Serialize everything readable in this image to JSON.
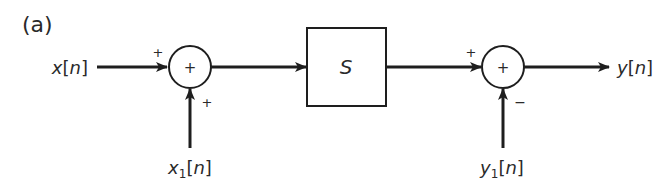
{
  "figure": {
    "panel_label": "(a)",
    "colors": {
      "stroke": "#1e1e1e",
      "text": "#2a2a2a",
      "background": "#ffffff"
    }
  },
  "signals": {
    "input": {
      "name": "x",
      "index": "n"
    },
    "input_aux": {
      "name": "x",
      "sub": "1",
      "index": "n"
    },
    "output": {
      "name": "y",
      "index": "n"
    },
    "output_aux": {
      "name": "y",
      "sub": "1",
      "index": "n"
    }
  },
  "blocks": {
    "system": {
      "label": "S"
    },
    "summer1": {
      "symbol": "+",
      "sign_left": "+",
      "sign_bottom": "+"
    },
    "summer2": {
      "symbol": "+",
      "sign_left": "+",
      "sign_bottom": "−"
    }
  }
}
